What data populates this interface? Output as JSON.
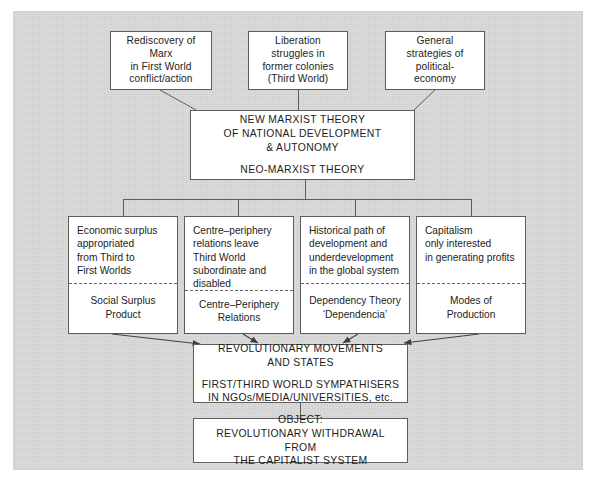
{
  "figure": {
    "kind": "flow-diagram",
    "panel_color": "#d6d6d6",
    "box_fill": "#ffffff",
    "line_color": "#5d5d5d"
  },
  "sources": [
    {
      "id": "rediscovery-of-marx",
      "text": "Rediscovery of\nMarx\nin First World\nconflict/action"
    },
    {
      "id": "liberation-struggles",
      "text": "Liberation\nstruggles in\nformer colonies\n(Third World)"
    },
    {
      "id": "general-strategies",
      "text": "General\nstrategies of\npolitical-\neconomy"
    }
  ],
  "theory": {
    "id": "neo-marxist-theory",
    "line1": "NEW MARXIST THEORY\nOF NATIONAL DEVELOPMENT\n& AUTONOMY",
    "line2": "NEO-MARXIST THEORY"
  },
  "concepts": [
    {
      "id": "social-surplus-product",
      "proposition": "Economic surplus\nappropriated\nfrom Third to\nFirst Worlds",
      "label": "Social Surplus\nProduct"
    },
    {
      "id": "centre-periphery-relations",
      "proposition": "Centre–periphery\nrelations leave\nThird World\nsubordinate and\ndisabled",
      "label": "Centre–Periphery\nRelations"
    },
    {
      "id": "dependency-theory",
      "proposition": "Historical path of\ndevelopment and\nunderdevelopment\nin the global system",
      "label": "Dependency Theory\n‘Dependencia’"
    },
    {
      "id": "modes-of-production",
      "proposition": "Capitalism\nonly interested\nin generating profits",
      "label": "Modes of\nProduction"
    }
  ],
  "outcomes": [
    {
      "id": "revolutionary-movements",
      "line1": "REVOLUTIONARY MOVEMENTS\nAND STATES",
      "line2": "FIRST/THIRD WORLD SYMPATHISERS\nIN NGOs/MEDIA/UNIVERSITIES, etc."
    },
    {
      "id": "object-revolutionary-withdrawal",
      "line1": "OBJECT:",
      "line2": "REVOLUTIONARY WITHDRAWAL FROM\nTHE CAPITALIST SYSTEM"
    }
  ]
}
